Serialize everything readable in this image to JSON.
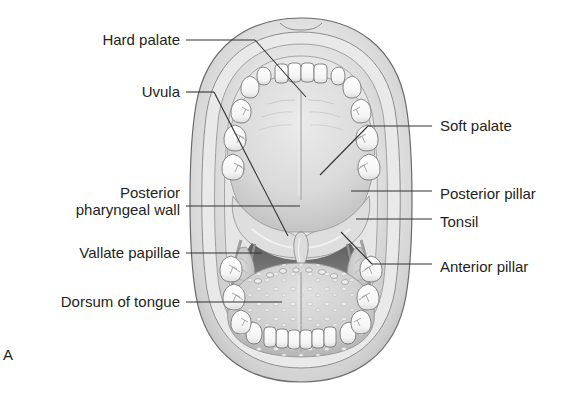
{
  "figure": {
    "panel_label": "A",
    "style": "grayscale anatomical line illustration"
  },
  "labels": {
    "left": [
      {
        "id": "hard-palate",
        "text": "Hard palate",
        "x": 180,
        "y": 40,
        "lead_from": [
          186,
          40
        ],
        "lead_to": [
          306,
          97
        ],
        "type": "diagonal"
      },
      {
        "id": "uvula",
        "text": "Uvula",
        "x": 180,
        "y": 92,
        "lead_from": [
          186,
          92
        ],
        "lead_to": [
          285,
          232
        ],
        "type": "diagonal"
      },
      {
        "id": "posterior-pharyngeal-wall",
        "line1": "Posterior",
        "line2": "pharyngeal wall",
        "text": "Posterior pharyngeal wall",
        "x": 180,
        "y": 192,
        "lead_from": [
          186,
          206
        ],
        "lead_to": [
          300,
          206
        ],
        "type": "horizontal"
      },
      {
        "id": "vallate-papillae",
        "text": "Vallate papillae",
        "x": 180,
        "y": 253,
        "lead_from": [
          186,
          253
        ],
        "lead_to": [
          262,
          253
        ],
        "type": "horizontal"
      },
      {
        "id": "dorsum-of-tongue",
        "text": "Dorsum of tongue",
        "x": 180,
        "y": 302,
        "lead_from": [
          186,
          302
        ],
        "lead_to": [
          282,
          302
        ],
        "type": "horizontal"
      }
    ],
    "right": [
      {
        "id": "soft-palate",
        "text": "Soft palate",
        "x": 440,
        "y": 126,
        "lead_from": [
          432,
          126
        ],
        "lead_to": [
          368,
          126
        ],
        "type": "horizontal"
      },
      {
        "id": "posterior-pillar",
        "text": "Posterior pillar",
        "x": 440,
        "y": 194,
        "lead_from": [
          432,
          191
        ],
        "lead_to": [
          351,
          191
        ],
        "type": "horizontal"
      },
      {
        "id": "tonsil",
        "text": "Tonsil",
        "x": 440,
        "y": 222,
        "lead_from": [
          432,
          219
        ],
        "lead_to": [
          356,
          219
        ],
        "type": "horizontal"
      },
      {
        "id": "anterior-pillar",
        "text": "Anterior pillar",
        "x": 440,
        "y": 267,
        "lead_from": [
          432,
          264
        ],
        "lead_to": [
          341,
          232
        ],
        "type": "diagonal"
      }
    ]
  },
  "colors": {
    "background": "#ffffff",
    "text": "#231f20",
    "leader_line": "#3a3a3a",
    "outline": "#5d5d5d",
    "lip_light": "#f2f2f2",
    "lip_mid": "#d8d8d8",
    "lip_shadow": "#b4b4b4",
    "mucosa": "#e3e3e3",
    "palate": "#dcdcdc",
    "palate_shadow": "#c2c2c2",
    "tooth": "#fdfdfd",
    "tooth_shade": "#e8e8e8",
    "tongue": "#d2d2d2",
    "tongue_shadow": "#b8b8b8",
    "oropharynx_dark": "#6e6e6e",
    "tonsil": "#c8c8c8"
  },
  "anatomy": {
    "mouth_bounds": {
      "x": 193,
      "y": 18,
      "width": 217,
      "height": 364
    },
    "parts": [
      "upper lip",
      "lower lip",
      "hard palate",
      "palatine raphe",
      "soft palate",
      "uvula",
      "anterior pillar",
      "posterior pillar",
      "palatine tonsil",
      "posterior pharyngeal wall",
      "dorsum of tongue",
      "vallate papillae",
      "upper dental arch",
      "lower dental arch"
    ],
    "tooth_counts": {
      "upper_arch": 16,
      "lower_arch": 16
    }
  }
}
